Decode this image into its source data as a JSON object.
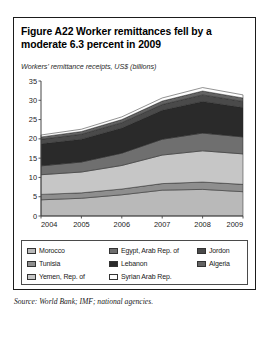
{
  "figure": {
    "title": "Figure A22  Worker remittances fell by a moderate 6.3 percent in 2009",
    "subtitle": "Workers' remittance receipts, US$ (billions)",
    "source": "Source: World Bank; IMF; national agencies."
  },
  "chart_data": {
    "type": "area",
    "stacked": true,
    "title": "Figure A22  Worker remittances fell by a moderate 6.3 percent in 2009",
    "subtitle": "Workers' remittance receipts, US$ (billions)",
    "xlabel": "",
    "ylabel": "",
    "x": [
      2004,
      2005,
      2006,
      2007,
      2008,
      2009
    ],
    "xticklabels": [
      "2004",
      "2005",
      "2006",
      "2007",
      "2008",
      "2009"
    ],
    "yticks": [
      0,
      5,
      10,
      15,
      20,
      25,
      30,
      35
    ],
    "yticklabels": [
      "0",
      "5",
      "10",
      "15",
      "20",
      "25",
      "30",
      "35"
    ],
    "ylim": [
      0,
      35
    ],
    "xlim": [
      2004,
      2009
    ],
    "grid": false,
    "legend_position": "below-plot",
    "series": [
      {
        "name": "Morocco",
        "color": "#b9b9b9",
        "values": [
          4.2,
          4.6,
          5.5,
          6.7,
          6.9,
          6.3
        ]
      },
      {
        "name": "Tunisia",
        "color": "#8e8e8e",
        "values": [
          1.4,
          1.4,
          1.5,
          1.7,
          1.9,
          1.9
        ]
      },
      {
        "name": "Yemen, Rep. of",
        "color": "#c6c6c6",
        "values": [
          5.1,
          5.4,
          6.1,
          7.4,
          8.1,
          7.9
        ]
      },
      {
        "name": "Egypt, Arab Rep. of",
        "color": "#6f6f6f",
        "values": [
          2.3,
          2.6,
          3.2,
          4.1,
          4.6,
          4.4
        ]
      },
      {
        "name": "Lebanon",
        "color": "#2a2a2a",
        "values": [
          5.7,
          5.9,
          6.5,
          7.5,
          8.2,
          7.6
        ]
      },
      {
        "name": "Jordon",
        "color": "#4a4a4a",
        "values": [
          1.2,
          1.3,
          1.4,
          1.5,
          1.7,
          1.6
        ]
      },
      {
        "name": "Algeria",
        "color": "#636363",
        "values": [
          0.6,
          0.7,
          0.8,
          0.9,
          1.0,
          0.9
        ]
      },
      {
        "name": "Syrian Arab Rep.",
        "color": "#fdfdfd",
        "values": [
          0.5,
          0.6,
          0.7,
          0.8,
          0.9,
          0.8
        ]
      }
    ],
    "totals": [
      21.0,
      22.5,
      25.7,
      30.6,
      33.3,
      31.4
    ],
    "annotations": []
  },
  "legend": {
    "items": [
      {
        "label": "Morocco",
        "color": "#b9b9b9"
      },
      {
        "label": "Egypt, Arab Rep. of",
        "color": "#6f6f6f"
      },
      {
        "label": "Jordon",
        "color": "#4a4a4a"
      },
      {
        "label": "Tunisia",
        "color": "#8e8e8e"
      },
      {
        "label": "Lebanon",
        "color": "#2a2a2a"
      },
      {
        "label": "Algeria",
        "color": "#636363"
      },
      {
        "label": "Yemen, Rep. of",
        "color": "#c6c6c6"
      },
      {
        "label": "Syrian Arab Rep.",
        "color": "#fdfdfd"
      }
    ]
  }
}
